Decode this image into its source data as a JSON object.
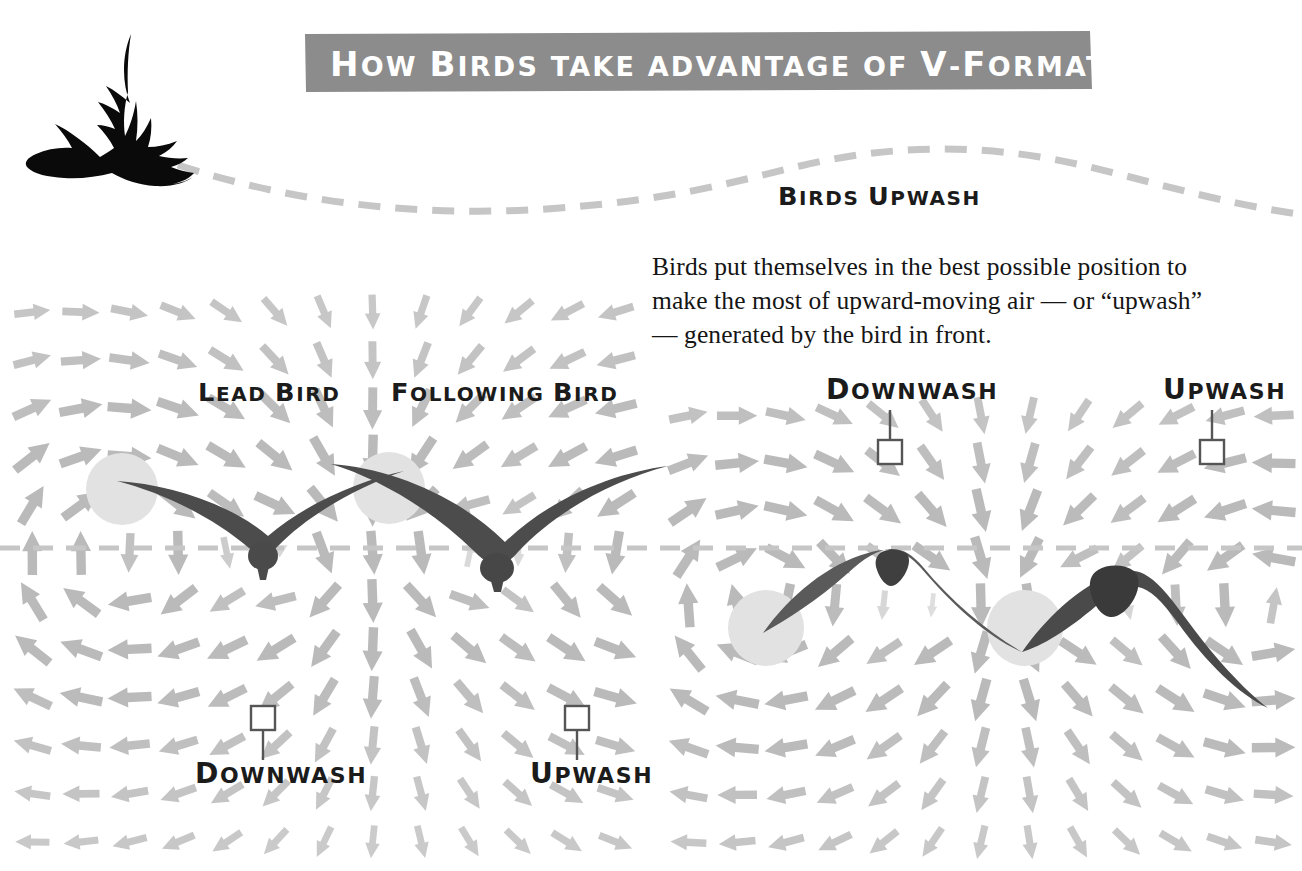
{
  "meta": {
    "width": 1302,
    "height": 871,
    "background": "#ffffff"
  },
  "colors": {
    "banner_bg": "#8c8c8c",
    "banner_text": "#ffffff",
    "ink": "#1b1b1b",
    "bird_silhouette": "#0a0a0a",
    "bird_body": "#4c4c4c",
    "bird_body_dark": "#3f3f3f",
    "vortex_circle": "#e2e2e2",
    "arrow_gray": "#bfbfbf",
    "arrow_gray_strong": "#b4b4b4",
    "arrow_gray_faint": "#d8d8d8",
    "dashed_line": "#c6c6c6",
    "marker_stroke": "#555555",
    "body_text": "#151515"
  },
  "header": {
    "title": "How Birds take advantage of V-Formation",
    "title_words": [
      "How",
      "Birds",
      "take",
      "advantage",
      "of",
      "V-Formation"
    ],
    "bird_icon": "flying-goose-silhouette"
  },
  "wave": {
    "label": "Birds Upwash",
    "style": "dashed",
    "description": "undulating dashed curve trailing behind the flying bird"
  },
  "intro": {
    "paragraph": "Birds put themselves in the best possible position to make the most of upward-moving air — or “upwash” — generated by the bird in front.",
    "lines": [
      "Birds put themselves in the best possible position to",
      "make the most of upward-moving air — or “upwash”",
      "— generated by the bird in front."
    ]
  },
  "left_panel": {
    "name": "v-formation-flow-field-left",
    "labels": {
      "lead_bird": "Lead Bird",
      "following_bird": "Following Bird",
      "downwash": "Downwash",
      "upwash": "Upwash"
    },
    "birds": [
      {
        "name": "lead-bird",
        "shape": "v-wings",
        "cx": 263,
        "cy": 552
      },
      {
        "name": "following-bird",
        "shape": "v-wings",
        "cx": 497,
        "cy": 567
      }
    ],
    "vortices": [
      {
        "cx": 122,
        "cy": 489,
        "r": 36
      },
      {
        "cx": 389,
        "cy": 488,
        "r": 36
      }
    ],
    "markers": [
      {
        "label": "Downwash",
        "x": 263,
        "y": 718,
        "leader": "down"
      },
      {
        "label": "Upwash",
        "x": 577,
        "y": 718,
        "leader": "down"
      }
    ]
  },
  "right_panel": {
    "name": "v-formation-flow-field-right",
    "labels": {
      "downwash": "Downwash",
      "upwash": "Upwash"
    },
    "birds": [
      {
        "name": "lead-bird-arched",
        "shape": "arch-wings",
        "cx": 897,
        "cy": 567
      },
      {
        "name": "following-bird-arched",
        "shape": "arch-wings",
        "cx": 1112,
        "cy": 572
      }
    ],
    "vortices": [
      {
        "cx": 766,
        "cy": 628,
        "r": 38
      },
      {
        "cx": 1025,
        "cy": 628,
        "r": 38
      }
    ],
    "markers": [
      {
        "label": "Downwash",
        "x": 890,
        "y": 452,
        "leader": "up"
      },
      {
        "label": "Upwash",
        "x": 1212,
        "y": 452,
        "leader": "up"
      }
    ]
  },
  "divider": {
    "name": "horizontal-dashed-axis",
    "y": 548,
    "style": "dashed"
  },
  "chart_data": {
    "type": "vector-field",
    "title": "How Birds take advantage of V-Formation",
    "annotations": [
      "Birds Upwash",
      "Lead Bird",
      "Following Bird",
      "Downwash",
      "Upwash"
    ]
  }
}
